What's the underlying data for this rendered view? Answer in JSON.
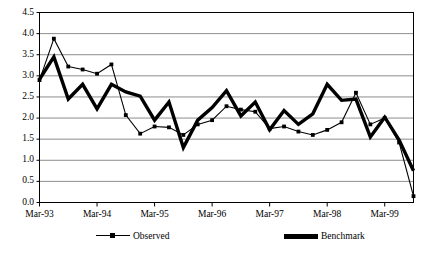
{
  "chart_data": {
    "type": "line",
    "title": "",
    "xlabel": "",
    "ylabel": "",
    "ylim": [
      0.0,
      4.5
    ],
    "ytick_step": 0.5,
    "grid": true,
    "legend_position": "bottom",
    "ytick_labels": [
      "4.5",
      "4.0",
      "3.5",
      "3.0",
      "2.5",
      "2.0",
      "1.5",
      "1.0",
      "0.5",
      "0.0"
    ],
    "ytick_values": [
      4.5,
      4.0,
      3.5,
      3.0,
      2.5,
      2.0,
      1.5,
      1.0,
      0.5,
      0.0
    ],
    "xtick_labels": [
      "Mar-93",
      "Mar-94",
      "Mar-95",
      "Mar-96",
      "Mar-97",
      "Mar-98",
      "Mar-99"
    ],
    "xtick_indices": [
      0,
      4,
      8,
      12,
      16,
      20,
      24
    ],
    "x": [
      0,
      1,
      2,
      3,
      4,
      5,
      6,
      7,
      8,
      9,
      10,
      11,
      12,
      13,
      14,
      15,
      16,
      17,
      18,
      19,
      20,
      21,
      22,
      23,
      24,
      25,
      26
    ],
    "series": [
      {
        "name": "Observed",
        "style": "thin-marker",
        "color": "#000000",
        "values": [
          2.9,
          3.88,
          3.22,
          3.15,
          3.05,
          3.27,
          2.07,
          1.63,
          1.8,
          1.78,
          1.6,
          1.85,
          1.95,
          2.28,
          2.2,
          2.15,
          1.75,
          1.8,
          1.68,
          1.6,
          1.72,
          1.9,
          2.6,
          1.85,
          2.0,
          1.42,
          0.15
        ]
      },
      {
        "name": "Benchmark",
        "style": "thick",
        "color": "#000000",
        "values": [
          2.92,
          3.45,
          2.45,
          2.8,
          2.22,
          2.8,
          2.62,
          2.52,
          1.95,
          2.38,
          1.3,
          1.95,
          2.25,
          2.65,
          2.05,
          2.38,
          1.72,
          2.18,
          1.85,
          2.1,
          2.8,
          2.42,
          2.45,
          1.55,
          2.02,
          1.48,
          0.75
        ]
      }
    ]
  },
  "legend": {
    "observed_label": "Observed",
    "benchmark_label": "Benchmark"
  }
}
